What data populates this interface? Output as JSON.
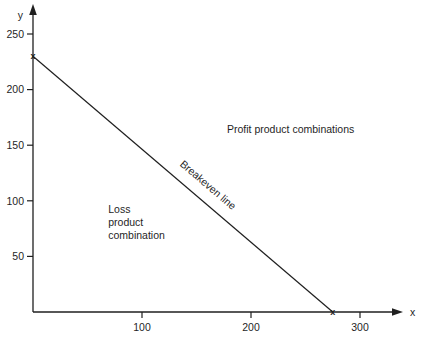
{
  "figure": {
    "background": "#ffffff",
    "ink": "#1f1f1f"
  },
  "chart_data": {
    "type": "line",
    "title": "",
    "xlabel": "x",
    "ylabel": "y",
    "xlim": [
      0,
      340
    ],
    "ylim": [
      0,
      265
    ],
    "x_ticks": [
      100,
      200,
      300
    ],
    "y_ticks": [
      50,
      100,
      150,
      200,
      250
    ],
    "grid": false,
    "legend": "none",
    "series": [
      {
        "name": "breakeven-line",
        "label": "Breakeven line",
        "marker": "x",
        "y_intercept": 230,
        "x_intercept": 275,
        "points": [
          {
            "x": 0,
            "y": 230
          },
          {
            "x": 275,
            "y": 0
          }
        ]
      }
    ],
    "annotations": [
      {
        "name": "profit-region-label",
        "lines": [
          "Profit product combinations"
        ],
        "x": 178,
        "y": 161
      },
      {
        "name": "loss-region-label",
        "lines": [
          "Loss",
          "product",
          "combination"
        ],
        "x": 69,
        "y": 89
      }
    ]
  }
}
